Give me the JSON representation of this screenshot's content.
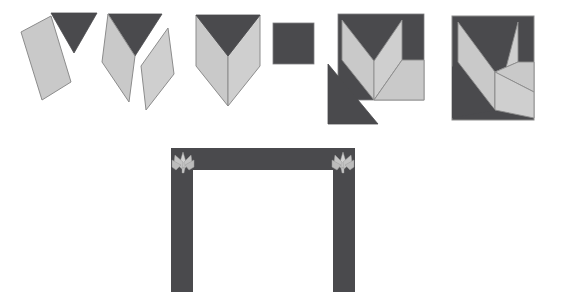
{
  "document": {
    "title": "Quilt Block Piecing Sequence",
    "type": "construction-diagram",
    "canvas": {
      "width": 571,
      "height": 290,
      "background": "#ffffff"
    }
  },
  "palette": {
    "dark": "#4a4a4d",
    "dark_shade": "#434347",
    "light": "#c9c9c9",
    "light_alt": "#d2d2d2",
    "light_shade": "#bcbcbc",
    "outline": "#8c8c8c",
    "outline_light": "#9a9a9a",
    "background": "#ffffff"
  },
  "top_row": {
    "label": "piecing-steps",
    "steps": [
      {
        "index": 1,
        "name": "step-1-single-diamond-and-triangle",
        "x": 20,
        "y": 12,
        "width": 72,
        "height": 108,
        "pieces": [
          "dark-triangle",
          "light-diamond-left"
        ]
      },
      {
        "index": 2,
        "name": "step-2-two-diamonds-with-triangle",
        "x": 100,
        "y": 12,
        "width": 76,
        "height": 108,
        "pieces": [
          "dark-triangle",
          "light-diamond-left",
          "light-diamond-right"
        ]
      },
      {
        "index": 3,
        "name": "step-3-joined-chevron-unit",
        "x": 192,
        "y": 12,
        "width": 72,
        "height": 104,
        "pieces": [
          "dark-chevron-top",
          "light-left-panel",
          "light-right-panel"
        ]
      },
      {
        "index": 4,
        "name": "step-4-dark-square",
        "x": 272,
        "y": 22,
        "width": 42,
        "height": 42,
        "pieces": [
          "dark-square"
        ]
      },
      {
        "index": 5,
        "name": "step-5-block-with-corner-triangle",
        "x": 326,
        "y": 12,
        "width": 98,
        "height": 118,
        "pieces": [
          "dark-background-square",
          "light-chevron",
          "light-diamond",
          "dark-corner-triangle"
        ]
      },
      {
        "index": 6,
        "name": "step-6-completed-block",
        "x": 450,
        "y": 14,
        "width": 82,
        "height": 110,
        "pieces": [
          "dark-background-square",
          "light-chevron",
          "light-diamond-right",
          "light-diamond-lower"
        ]
      }
    ]
  },
  "bottom": {
    "name": "border-frame-with-corner-motifs",
    "x": 168,
    "y": 148,
    "width": 186,
    "height": 142,
    "band_width": 22,
    "corner_motifs": [
      {
        "name": "corner-motif-left",
        "x": 171,
        "y": 150,
        "size": 26,
        "mirrored": false
      },
      {
        "name": "corner-motif-right",
        "x": 320,
        "y": 150,
        "size": 26,
        "mirrored": true
      }
    ],
    "inner_fill": "#ffffff"
  }
}
